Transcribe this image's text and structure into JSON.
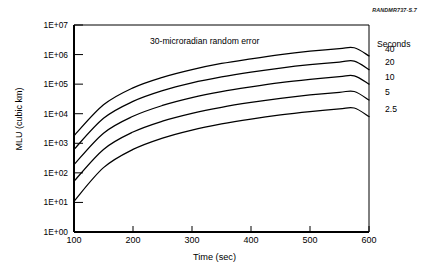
{
  "source_tag": "RANDMR737-S.7",
  "chart_data": {
    "type": "line",
    "title": "30-microradian random error",
    "xlabel": "Time (sec)",
    "ylabel": "MLU (cubic km)",
    "xlim": [
      100,
      600
    ],
    "ylim": [
      1,
      10000000
    ],
    "yscale": "log",
    "grid": false,
    "legend_position": "right",
    "legend_title": "Seconds",
    "xticks": [
      100,
      200,
      300,
      400,
      500,
      600
    ],
    "xtick_labels": [
      "100",
      "200",
      "300",
      "400",
      "500",
      "600"
    ],
    "yticks": [
      1,
      10,
      100,
      1000,
      10000,
      100000,
      1000000,
      10000000
    ],
    "ytick_labels": [
      "1E+00",
      "1E+01",
      "1E+02",
      "1E+03",
      "1E+04",
      "1E+05",
      "1E+06",
      "1E+07"
    ],
    "x": [
      100,
      150,
      200,
      250,
      300,
      350,
      400,
      450,
      500,
      550,
      575,
      600
    ],
    "series": [
      {
        "name": "40",
        "label": "40",
        "values": [
          1800,
          20000,
          75000,
          170000,
          310000,
          500000,
          720000,
          1000000,
          1300000,
          1600000,
          1700000,
          900000
        ]
      },
      {
        "name": "20",
        "label": "20",
        "values": [
          620,
          7000,
          26000,
          60000,
          110000,
          175000,
          255000,
          350000,
          455000,
          560000,
          600000,
          310000
        ]
      },
      {
        "name": "10",
        "label": "10",
        "values": [
          190,
          2200,
          8200,
          19000,
          35000,
          56000,
          81000,
          112000,
          145000,
          180000,
          192000,
          100000
        ]
      },
      {
        "name": "5",
        "label": "5",
        "values": [
          52,
          620,
          2400,
          5600,
          10300,
          16500,
          24000,
          33000,
          43000,
          53000,
          56500,
          29000
        ]
      },
      {
        "name": "2.5",
        "label": "2.5",
        "values": [
          11,
          150,
          620,
          1500,
          2800,
          4500,
          6600,
          9100,
          11800,
          14600,
          15600,
          8000
        ]
      }
    ]
  }
}
